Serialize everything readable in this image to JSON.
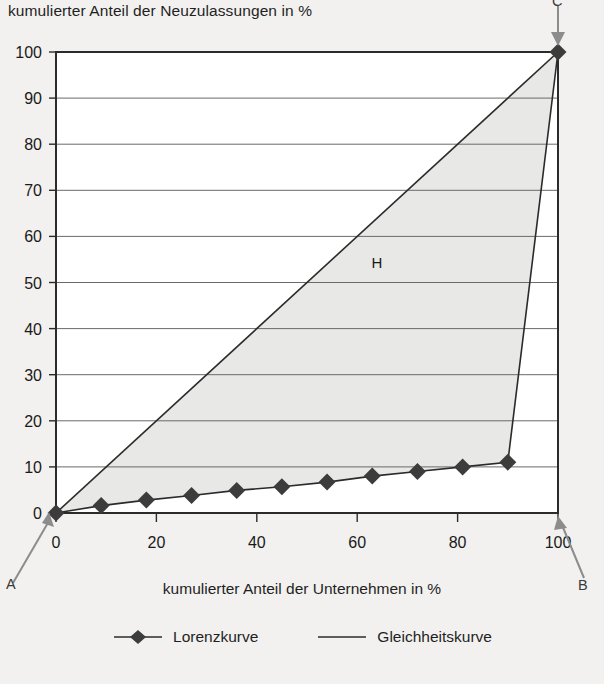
{
  "chart_data": {
    "type": "line",
    "title": "",
    "ylabel": "kumulierter Anteil der Neuzulassungen in %",
    "xlabel": "kumulierter Anteil der Unternehmen in %",
    "xlim": [
      0,
      100
    ],
    "ylim": [
      0,
      100
    ],
    "grid": true,
    "x_ticks": [
      0,
      20,
      40,
      60,
      80,
      100
    ],
    "y_ticks": [
      0,
      10,
      20,
      30,
      40,
      50,
      60,
      70,
      80,
      90,
      100
    ],
    "legend_position": "bottom",
    "series": [
      {
        "name": "Lorenzkurve",
        "marker": "diamond",
        "color": "#3c3c3c",
        "x": [
          0,
          9,
          18,
          27,
          36,
          45,
          54,
          63,
          72,
          81,
          90,
          100
        ],
        "values": [
          0,
          1.6,
          2.8,
          3.8,
          4.9,
          5.7,
          6.7,
          8.0,
          9.0,
          10.0,
          11.0,
          100
        ]
      },
      {
        "name": "Gleichheitskurve",
        "marker": "none",
        "color": "#3c3c3c",
        "x": [
          0,
          100
        ],
        "values": [
          0,
          100
        ]
      }
    ],
    "annotations": [
      {
        "text": "A",
        "role": "origin-corner",
        "x": 0,
        "y": 0
      },
      {
        "text": "B",
        "role": "lower-right-corner",
        "x": 100,
        "y": 0
      },
      {
        "text": "C",
        "role": "upper-right-corner",
        "x": 100,
        "y": 100
      },
      {
        "text": "H",
        "role": "concentration-area",
        "x": 55,
        "y": 52
      }
    ],
    "shaded_area": {
      "label": "H",
      "fill": "#e8e8e6",
      "between": [
        "Gleichheitskurve",
        "Lorenzkurve"
      ]
    }
  },
  "axes": {
    "y_title": "kumulierter Anteil der Neuzulassungen in %",
    "x_title": "kumulierter Anteil der Unternehmen in %",
    "y_tick_labels": [
      "100",
      "90",
      "80",
      "70",
      "60",
      "50",
      "40",
      "30",
      "20",
      "10",
      "0"
    ],
    "x_tick_labels": [
      "0",
      "20",
      "40",
      "60",
      "80",
      "100"
    ]
  },
  "labels": {
    "a": "A",
    "b": "B",
    "c": "C",
    "h": "H"
  },
  "legend": {
    "items": [
      {
        "label": "Lorenzkurve",
        "marker": "diamond-line-marker"
      },
      {
        "label": "Gleichheitskurve",
        "marker": "plain-line-marker"
      }
    ]
  },
  "colors": {
    "background": "#f2f1ef",
    "plot_background": "#ffffff",
    "shade": "#e8e8e6",
    "axis": "#2b2b2b",
    "gridline": "#5a5a5a",
    "series": "#3c3c3c"
  }
}
